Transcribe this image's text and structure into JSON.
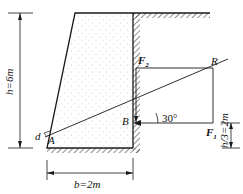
{
  "diagram": {
    "type": "retaining-wall-force-diagram",
    "labels": {
      "height": "h=6m",
      "base": "b=2m",
      "third_height": "h/3=2m",
      "force1": "F",
      "force1_sub": "1",
      "force2": "F",
      "force2_sub": "2",
      "resultant": "R",
      "point_a": "A",
      "point_b": "B",
      "distance": "d",
      "angle": "30°"
    },
    "colors": {
      "stroke": "#1a1a1a",
      "fill": "#f7f7f7",
      "dots": "#bdbdbd"
    }
  }
}
